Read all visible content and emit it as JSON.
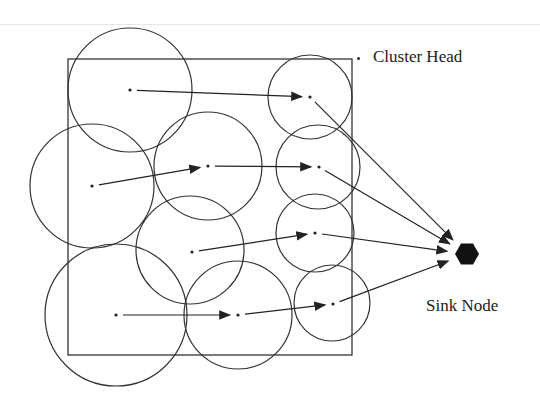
{
  "diagram": {
    "type": "cluster-based wireless sensor network",
    "legend": {
      "symbol": "dot",
      "label": "Cluster Head"
    },
    "sink": {
      "label": "Sink Node",
      "shape": "hexagon",
      "color": "#111111"
    },
    "field": {
      "shape": "square",
      "stroke": "#333333"
    },
    "clusters": [
      {
        "id": "c1",
        "cx": 130,
        "cy": 90,
        "r": 62,
        "head": [
          130,
          90
        ]
      },
      {
        "id": "c2",
        "cx": 92,
        "cy": 186,
        "r": 62,
        "head": [
          92,
          186
        ]
      },
      {
        "id": "c3",
        "cx": 208,
        "cy": 166,
        "r": 54,
        "head": [
          208,
          166
        ]
      },
      {
        "id": "c4",
        "cx": 190,
        "cy": 250,
        "r": 54,
        "head": [
          192,
          252
        ]
      },
      {
        "id": "c5",
        "cx": 310,
        "cy": 97,
        "r": 42,
        "head": [
          310,
          97
        ]
      },
      {
        "id": "c6",
        "cx": 318,
        "cy": 167,
        "r": 42,
        "head": [
          319,
          167
        ]
      },
      {
        "id": "c7",
        "cx": 315,
        "cy": 233,
        "r": 39,
        "head": [
          315,
          233
        ]
      },
      {
        "id": "c8",
        "cx": 332,
        "cy": 303,
        "r": 38,
        "head": [
          333,
          304
        ]
      },
      {
        "id": "c9",
        "cx": 116,
        "cy": 315,
        "r": 71,
        "head": [
          116,
          315
        ]
      },
      {
        "id": "c10",
        "cx": 238,
        "cy": 315,
        "r": 54,
        "head": [
          238,
          315
        ]
      }
    ],
    "links": [
      {
        "from": "c1",
        "to": "c5"
      },
      {
        "from": "c2",
        "to": "c3"
      },
      {
        "from": "c3",
        "to": "c6"
      },
      {
        "from": "c4",
        "to": "c7"
      },
      {
        "from": "c9",
        "to": "c10"
      },
      {
        "from": "c10",
        "to": "c8"
      },
      {
        "from": "c5",
        "to": "sink"
      },
      {
        "from": "c6",
        "to": "sink"
      },
      {
        "from": "c7",
        "to": "sink"
      },
      {
        "from": "c8",
        "to": "sink"
      }
    ]
  }
}
